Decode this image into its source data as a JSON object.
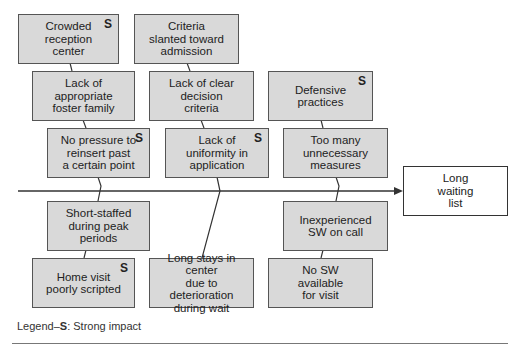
{
  "diagram": {
    "type": "fishbone",
    "effect": "Long\nwaiting\nlist",
    "upper_causes": [
      {
        "id": "A",
        "text": "Crowded\nreception\ncenter",
        "strong": true
      },
      {
        "id": "B",
        "text": "Criteria\nslanted toward\nadmission",
        "strong": false
      },
      {
        "id": "C",
        "text": "Lack of\nappropriate\nfoster family",
        "strong": false
      },
      {
        "id": "D",
        "text": "Lack of clear\ndecision\ncriteria",
        "strong": false
      },
      {
        "id": "E",
        "text": "Defensive\npractices",
        "strong": true
      },
      {
        "id": "F",
        "text": "No pressure to\nreinsert past\na certain point",
        "strong": true
      },
      {
        "id": "G",
        "text": "Lack of\nuniformity in\napplication",
        "strong": true
      },
      {
        "id": "H",
        "text": "Too many\nunnecessary\nmeasures",
        "strong": false
      }
    ],
    "lower_causes": [
      {
        "id": "I",
        "text": "Short-staffed\nduring peak\nperiods",
        "strong": false
      },
      {
        "id": "J",
        "text": "Inexperienced\nSW on call",
        "strong": false
      },
      {
        "id": "K",
        "text": "Home visit\npoorly scripted",
        "strong": true
      },
      {
        "id": "L",
        "text": "Long stays in center\ndue to deterioration\nduring wait",
        "strong": false
      },
      {
        "id": "M",
        "text": "No SW\navailable\nfor visit",
        "strong": false
      }
    ],
    "strong_marker": "S"
  },
  "legend": {
    "prefix": "Legend–",
    "marker": "S",
    "suffix": ": Strong impact"
  },
  "colors": {
    "box_fill": "#d9d9d9",
    "box_border": "#555555",
    "line": "#333333"
  }
}
